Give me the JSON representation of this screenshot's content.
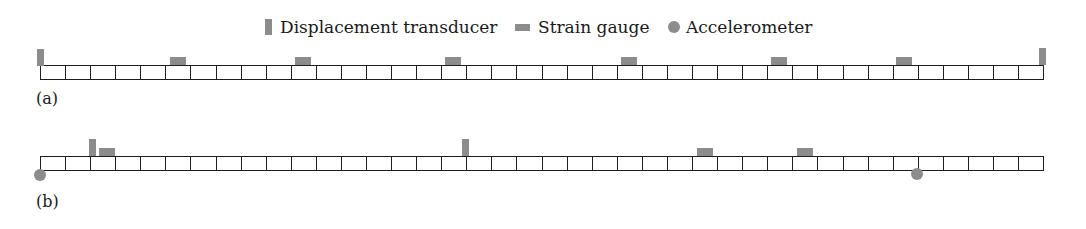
{
  "legend": {
    "transducer_label": "Displacement transducer",
    "strain_label": "Strain gauge",
    "accelerometer_label": "Accelerometer"
  },
  "colors": {
    "sensor": "#8c8c8c",
    "grid_line": "#1e1e1e"
  },
  "grid": {
    "cell_count": 40,
    "left_px": 40,
    "right_px": 1044,
    "cell_width_px": 25.1
  },
  "panels": [
    {
      "label": "(a)",
      "sensors": [
        {
          "type": "displacement-transducer",
          "position": "left end",
          "x": 37
        },
        {
          "type": "strain-gauge",
          "cell": 6,
          "x": 170
        },
        {
          "type": "strain-gauge",
          "cell": 11,
          "x": 295
        },
        {
          "type": "strain-gauge",
          "cell": 17,
          "x": 445
        },
        {
          "type": "strain-gauge",
          "cell": 24,
          "x": 621
        },
        {
          "type": "strain-gauge",
          "cell": 30,
          "x": 771
        },
        {
          "type": "strain-gauge",
          "cell": 35,
          "x": 896
        },
        {
          "type": "displacement-transducer",
          "position": "right end",
          "x": 1039
        }
      ]
    },
    {
      "label": "(b)",
      "sensors": [
        {
          "type": "accelerometer",
          "position": "left end, below",
          "x": 40
        },
        {
          "type": "displacement-transducer",
          "x": 89
        },
        {
          "type": "strain-gauge",
          "cell": 3,
          "x": 99
        },
        {
          "type": "displacement-transducer",
          "x": 462
        },
        {
          "type": "strain-gauge",
          "cell": 27,
          "x": 697
        },
        {
          "type": "strain-gauge",
          "cell": 31,
          "x": 797
        },
        {
          "type": "accelerometer",
          "position": "below",
          "x": 917
        }
      ]
    }
  ]
}
